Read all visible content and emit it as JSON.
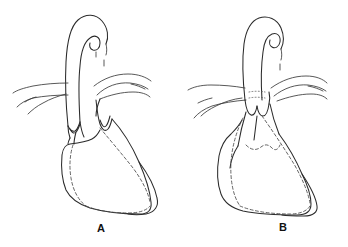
{
  "plate": {
    "background_color": "#ffffff",
    "ink_color": "#2b2b2b",
    "width": 348,
    "height": 247,
    "figure_type": "scientific-line-drawing",
    "caption": ""
  },
  "figures": [
    {
      "id": "A",
      "label": "A",
      "label_x": 101,
      "label_y": 232,
      "parts": {
        "apical_hook": "curved hook-shaped apical process",
        "shaft": "vertical tapering shaft",
        "lateral_membrane_left": "left lateral membranous expansion",
        "lateral_membrane_right": "right lateral membranous expansion",
        "basal_lobes": "paired scalloped basal lobes",
        "sac": "lower sac with dashed internal outline"
      }
    },
    {
      "id": "B",
      "label": "B",
      "label_x": 283,
      "label_y": 231,
      "parts": {
        "apical_hook": "curved hook-shaped apical process",
        "shaft": "vertical tapering shaft",
        "lateral_membrane_left": "left lateral membranous expansion",
        "lateral_membrane_right": "right lateral membranous expansion",
        "basal_lobes": "paired scalloped basal lobes",
        "sac": "lower sac with dashed internal outline"
      }
    }
  ]
}
